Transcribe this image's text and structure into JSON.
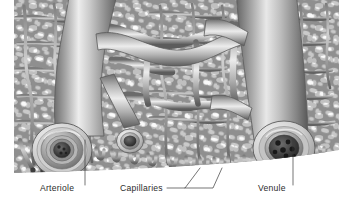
{
  "figure": {
    "style": "grayscale anatomical airbrush illustration",
    "background_color": "#ffffff",
    "canvas": {
      "width": 340,
      "height": 205
    },
    "illustration_bounds": {
      "x": 14,
      "y": 0,
      "width": 325,
      "height": 176
    }
  },
  "palette": {
    "background": "#ffffff",
    "vessel_light": "#f2f2f2",
    "vessel_mid": "#9a9a9a",
    "vessel_dark": "#4a4a4a",
    "mesh_fill": "#8f8f8f",
    "mesh_hole": "#fbfbfb",
    "outline": "#5a5a5a",
    "lumen_dark": "#2a2a2a",
    "label_color": "#2b2b2b",
    "leader_color": "#3a3a3a"
  },
  "labels": [
    {
      "id": "arteriole",
      "text": "Arteriole",
      "x": 40,
      "y": 190,
      "anchor": "start",
      "leader": {
        "type": "vertical",
        "points": "85,185 85,140"
      }
    },
    {
      "id": "capillaries",
      "text": "Capillaries",
      "x": 120,
      "y": 190,
      "anchor": "start",
      "leader": {
        "type": "branched",
        "points": "167,188 185,188 200,168",
        "points2": "185,188 213,188 222,168"
      }
    },
    {
      "id": "venule",
      "text": "Venule",
      "x": 258,
      "y": 190,
      "anchor": "start",
      "leader": {
        "type": "vertical",
        "points": "293,185 293,140"
      }
    }
  ],
  "structures": {
    "arteriole": {
      "name": "Arteriole",
      "position": "lower-left",
      "cross_section": {
        "center_x": 62,
        "center_y": 150,
        "outer_radius": 28,
        "wall_rings": 4,
        "lumen_radius": 9,
        "description": "thick muscular wall shown as concentric rings, small dark lumen"
      }
    },
    "capillary_bed": {
      "name": "Capillaries",
      "position": "center",
      "description": "dense anastomosing mesh of fine vessels with pale interstitial spaces",
      "loop_count": 11
    },
    "venule": {
      "name": "Venule",
      "position": "lower-right",
      "cross_section": {
        "center_x": 284,
        "center_y": 148,
        "outer_radius": 30,
        "wall_rings": 2,
        "lumen_radius": 15,
        "description": "thin wall, wide lumen containing red blood cells",
        "blood_cell_count": 7
      }
    },
    "cut_branch": {
      "name": "cut capillary branch",
      "center_x": 130,
      "center_y": 141,
      "outer_radius": 13,
      "lumen_radius": 8
    }
  }
}
